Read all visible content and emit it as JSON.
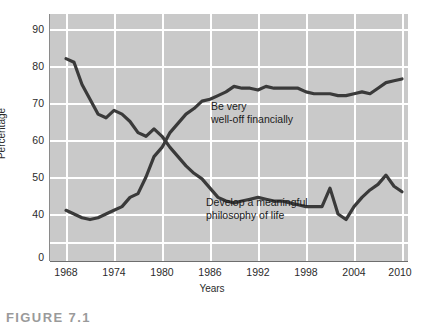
{
  "chart_data": {
    "type": "line",
    "title": "",
    "xlabel": "Years",
    "ylabel": "Percentage",
    "xlim": [
      1966,
      2011
    ],
    "ylim": [
      35,
      93
    ],
    "grid": true,
    "legend_position": "inline-annotation",
    "x_ticks": [
      "1968",
      "1974",
      "1980",
      "1986",
      "1992",
      "1998",
      "2004",
      "2010"
    ],
    "x_tick_values": [
      1968,
      1974,
      1980,
      1986,
      1992,
      1998,
      2004,
      2010
    ],
    "y_ticks": [
      "90",
      "80",
      "70",
      "60",
      "50",
      "40",
      "0"
    ],
    "y_tick_values": [
      90,
      80,
      70,
      60,
      50,
      40,
      0
    ],
    "y_axis_break": true,
    "y_axis_break_note": "Axis is broken between 40 and 0",
    "series": [
      {
        "name": "Be very well-off financially",
        "color": "#3a3a3a",
        "x": [
          1968,
          1969,
          1970,
          1971,
          1972,
          1973,
          1974,
          1975,
          1976,
          1977,
          1978,
          1979,
          1980,
          1981,
          1982,
          1983,
          1984,
          1985,
          1986,
          1987,
          1988,
          1989,
          1990,
          1991,
          1992,
          1993,
          1994,
          1995,
          1996,
          1997,
          1998,
          1999,
          2000,
          2001,
          2002,
          2003,
          2004,
          2005,
          2006,
          2007,
          2008,
          2009,
          2010
        ],
        "values": [
          41,
          40,
          39,
          38.5,
          39,
          40,
          41,
          42,
          44.5,
          45.5,
          50,
          55.5,
          58,
          62,
          64.5,
          67,
          68.5,
          70.5,
          71,
          72,
          73,
          74.5,
          74,
          74,
          73.5,
          74.5,
          74,
          74,
          74,
          74,
          73,
          72.5,
          72.5,
          72.5,
          72,
          72,
          72.5,
          73,
          72.5,
          74,
          75.5,
          76,
          76.5
        ]
      },
      {
        "name": "Develop a meaningful philosophy of life",
        "color": "#3a3a3a",
        "x": [
          1968,
          1969,
          1970,
          1971,
          1972,
          1973,
          1974,
          1975,
          1976,
          1977,
          1978,
          1979,
          1980,
          1981,
          1982,
          1983,
          1984,
          1985,
          1986,
          1987,
          1988,
          1989,
          1990,
          1991,
          1992,
          1993,
          1994,
          1995,
          1996,
          1997,
          1998,
          1999,
          2000,
          2001,
          2002,
          2003,
          2004,
          2005,
          2006,
          2007,
          2008,
          2009,
          2010
        ],
        "values": [
          82,
          81,
          75,
          71,
          67,
          66,
          68,
          67,
          65,
          62,
          61,
          63,
          61,
          58,
          55.5,
          53,
          51,
          49.5,
          47,
          44.5,
          43.5,
          43,
          43.5,
          44,
          44.5,
          44,
          43.5,
          43.5,
          43,
          42.5,
          42,
          42,
          42,
          47,
          40,
          38.5,
          42,
          44.5,
          46.5,
          48,
          50.5,
          47.5,
          46
        ]
      }
    ],
    "annotations": [
      {
        "name": "well-off-label",
        "text": "Be very\nwell-off financially",
        "x_px": 211,
        "y_px": 100
      },
      {
        "name": "philosophy-label",
        "text": "Develop a meaningful\nphilosophy of life",
        "x_px": 206,
        "y_px": 196
      }
    ]
  },
  "caption": {
    "text": "FIGURE 7.1"
  }
}
